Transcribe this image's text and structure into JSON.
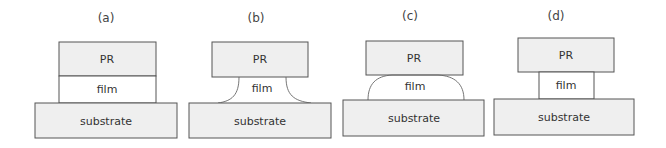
{
  "diagram": {
    "panels": [
      {
        "id": "a",
        "label": "(a)",
        "pr": "PR",
        "film": "film",
        "substrate": "substrate",
        "film_shape": "vertical-sidewall"
      },
      {
        "id": "b",
        "label": "(b)",
        "pr": "PR",
        "film": "film",
        "substrate": "substrate",
        "film_shape": "concave-undercut"
      },
      {
        "id": "c",
        "label": "(c)",
        "pr": "PR",
        "film": "film",
        "substrate": "substrate",
        "film_shape": "convex-dome"
      },
      {
        "id": "d",
        "label": "(d)",
        "pr": "PR",
        "film": "film",
        "substrate": "substrate",
        "film_shape": "narrow-vertical"
      }
    ]
  }
}
